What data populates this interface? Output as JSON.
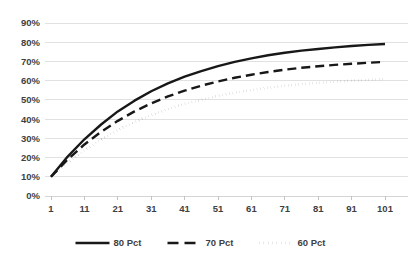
{
  "chart_data": {
    "type": "line",
    "title": "",
    "subtitle": "",
    "xlabel": "",
    "ylabel": "",
    "grid": "horizontal",
    "legend_position": "bottom",
    "xlim": [
      1,
      101
    ],
    "ylim": [
      0,
      0.9
    ],
    "x_tick_labels": [
      "1",
      "11",
      "21",
      "31",
      "41",
      "51",
      "61",
      "71",
      "81",
      "91",
      "101"
    ],
    "x_tick_values": [
      1,
      11,
      21,
      31,
      41,
      51,
      61,
      71,
      81,
      91,
      101
    ],
    "y_tick_labels": [
      "0%",
      "10%",
      "20%",
      "30%",
      "40%",
      "50%",
      "60%",
      "70%",
      "80%",
      "90%"
    ],
    "y_tick_values": [
      0,
      0.1,
      0.2,
      0.3,
      0.4,
      0.5,
      0.6,
      0.7,
      0.8,
      0.9
    ],
    "x": [
      1,
      6,
      11,
      16,
      21,
      26,
      31,
      36,
      41,
      46,
      51,
      56,
      61,
      66,
      71,
      76,
      81,
      86,
      91,
      96,
      101
    ],
    "series": [
      {
        "name": "80 Pct",
        "style": "solid",
        "color": "#181818",
        "values": [
          0.1,
          0.205,
          0.295,
          0.372,
          0.44,
          0.496,
          0.545,
          0.586,
          0.621,
          0.65,
          0.676,
          0.698,
          0.716,
          0.732,
          0.745,
          0.756,
          0.765,
          0.773,
          0.78,
          0.786,
          0.791
        ]
      },
      {
        "name": "70 Pct",
        "style": "dashed",
        "color": "#181818",
        "values": [
          0.1,
          0.19,
          0.268,
          0.334,
          0.391,
          0.44,
          0.482,
          0.518,
          0.548,
          0.574,
          0.596,
          0.615,
          0.631,
          0.645,
          0.657,
          0.667,
          0.675,
          0.682,
          0.688,
          0.693,
          0.698
        ]
      },
      {
        "name": "60 Pct",
        "style": "dotted",
        "color": "#181818",
        "values": [
          0.1,
          0.173,
          0.238,
          0.294,
          0.343,
          0.385,
          0.421,
          0.452,
          0.479,
          0.501,
          0.521,
          0.537,
          0.551,
          0.563,
          0.573,
          0.582,
          0.589,
          0.595,
          0.6,
          0.604,
          0.608
        ]
      }
    ],
    "legend_entries": [
      {
        "label": "80 Pct",
        "style": "solid"
      },
      {
        "label": "70 Pct",
        "style": "dashed"
      },
      {
        "label": "60 Pct",
        "style": "dotted"
      }
    ]
  }
}
